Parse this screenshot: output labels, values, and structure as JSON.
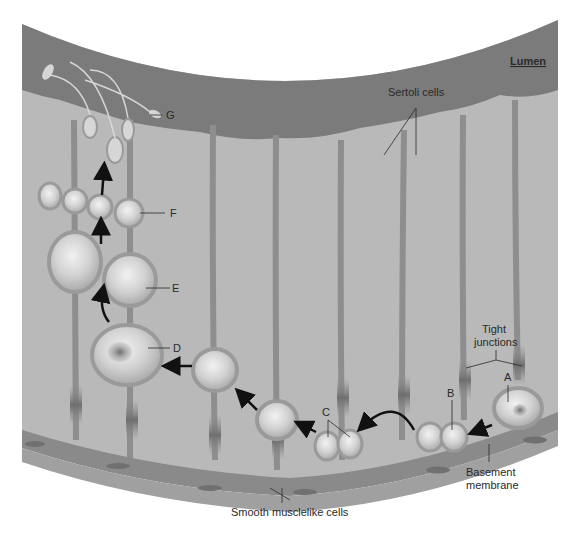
{
  "diagram": {
    "region_label": "Lumen",
    "labels": {
      "sertoli": "Sertoli cells",
      "tight_junctions_line1": "Tight",
      "tight_junctions_line2": "junctions",
      "basement_line1": "Basement",
      "basement_line2": "membrane",
      "smooth_muscle": "Smooth musclelike cells",
      "A": "A",
      "B": "B",
      "C": "C",
      "D": "D",
      "E": "E",
      "F": "F",
      "G": "G"
    },
    "stages": [
      {
        "id": "A",
        "description": "Spermatogonium at basement membrane"
      },
      {
        "id": "B",
        "description": "Paired daughter cells"
      },
      {
        "id": "C",
        "description": "Cells passing tight junctions"
      },
      {
        "id": "D",
        "description": "Large primary spermatocyte"
      },
      {
        "id": "E",
        "description": "Secondary spermatocytes"
      },
      {
        "id": "F",
        "description": "Spermatids"
      },
      {
        "id": "G",
        "description": "Spermatozoa released into lumen"
      }
    ],
    "colors": {
      "lumen": "#7b7b7b",
      "tissue": "#b9b9b9",
      "sertoli_stalk": "#8e8e8e",
      "cell_fill": "#d4d4d4",
      "cell_rim": "#9a9a9a",
      "basement": "#8a8a8a",
      "muscle_layer": "#9c9c9c",
      "arrow": "#111111",
      "text": "#2a2a2a"
    }
  }
}
